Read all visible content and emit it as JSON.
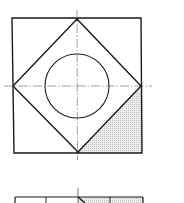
{
  "diagram": {
    "type": "technical-drawing",
    "colors": {
      "background": "#ffffff",
      "line": "#1a1a1a",
      "centerline": "#777777",
      "hatch": "#cfcfcf"
    },
    "top_view": {
      "outer_square": {
        "x1": 12,
        "y1": 18,
        "x2": 142,
        "y2": 153
      },
      "diamond": {
        "top": [
          77,
          19
        ],
        "right": [
          141,
          86
        ],
        "bottom": [
          78,
          152
        ],
        "left": [
          13,
          86
        ]
      },
      "circle": {
        "cx": 77,
        "cy": 86,
        "r": 32
      },
      "centerlines": {
        "vertical": {
          "x": 77,
          "y1": 10,
          "y2": 160
        },
        "horizontal": {
          "y": 86,
          "x1": 4,
          "x2": 152
        }
      },
      "shaded_region": "bottom-right triangle between diamond and outer square"
    },
    "bottom_view": {
      "top_edge_y": 197,
      "x1": 15,
      "x2": 143,
      "ticks_x": [
        46,
        110
      ],
      "center_x": 78,
      "centerline_top_y": 188,
      "shaded_from_x": 78
    }
  }
}
